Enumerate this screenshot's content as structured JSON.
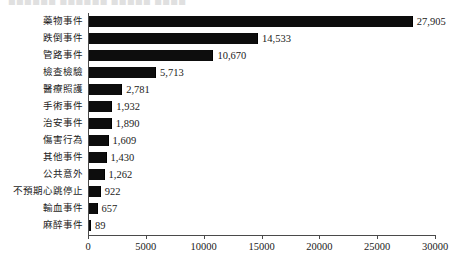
{
  "clipped_header": {
    "text": "■■■■■■ ■■■■■■ ■■■■■ ■■■■"
  },
  "chart_data": {
    "type": "bar",
    "orientation": "horizontal",
    "title": "",
    "subtitle": "",
    "xlabel": "",
    "ylabel": "",
    "grid": false,
    "legend": null,
    "xlim": [
      0,
      30000
    ],
    "xticks": [
      0,
      5000,
      10000,
      15000,
      20000,
      25000,
      30000
    ],
    "xtick_labels": [
      "0",
      "5000",
      "10000",
      "15000",
      "20000",
      "25000",
      "30000"
    ],
    "bar_color": "#0d0d0d",
    "background_color": "#ffffff",
    "categories": [
      "藥物事件",
      "跌倒事件",
      "管路事件",
      "檢查檢驗",
      "醫療照護",
      "手術事件",
      "治安事件",
      "傷害行為",
      "其他事件",
      "公共意外",
      "不預期心跳停止",
      "輸血事件",
      "麻醉事件"
    ],
    "values": [
      27905,
      14533,
      10670,
      5713,
      2781,
      1932,
      1890,
      1609,
      1430,
      1262,
      922,
      657,
      89
    ],
    "value_labels": [
      "27,905",
      "14,533",
      "10,670",
      "5,713",
      "2,781",
      "1,932",
      "1,890",
      "1,609",
      "1,430",
      "1,262",
      "922",
      "657",
      "89"
    ]
  }
}
